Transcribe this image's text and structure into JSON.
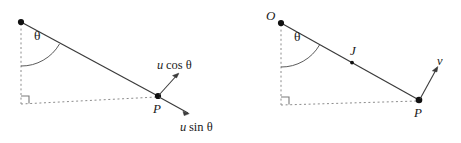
{
  "figure": {
    "background_color": "#ffffff",
    "stroke_color": "#3a3a3a",
    "dashed_color": "#808080",
    "text_color": "#1a1a1a",
    "panels": [
      {
        "id": "left-panel",
        "name": "projectile-components-diagram",
        "points": [
          {
            "id": "origin",
            "label": "",
            "x": 21,
            "y": 22
          },
          {
            "id": "point-p",
            "label": "P",
            "x": 158,
            "y": 96
          }
        ],
        "angle_label": "θ",
        "angle_vertex": "origin",
        "vector_labels": [
          {
            "id": "u-cos-theta",
            "symbol": "u",
            "fn": "cos θ",
            "text": "u cos θ"
          },
          {
            "id": "u-sin-theta",
            "symbol": "u",
            "fn": "sin θ",
            "text": "u sin θ"
          }
        ],
        "right_angle": true
      },
      {
        "id": "right-panel",
        "name": "velocity-vector-diagram",
        "points": [
          {
            "id": "origin-o",
            "label": "O",
            "x": 281,
            "y": 23
          },
          {
            "id": "point-j",
            "label": "J",
            "x": 352,
            "y": 62
          },
          {
            "id": "point-p",
            "label": "P",
            "x": 419,
            "y": 100
          }
        ],
        "angle_label": "θ",
        "angle_vertex": "origin-o",
        "vector_labels": [
          {
            "id": "v-vector",
            "symbol": "v",
            "text": "v"
          }
        ],
        "right_angle": true
      }
    ]
  },
  "labels": {
    "left": {
      "theta": "θ",
      "p": "P",
      "u_cos_u": "u",
      "u_cos_rest": "cos θ",
      "u_sin_u": "u",
      "u_sin_rest": "sin θ"
    },
    "right": {
      "o": "O",
      "theta": "θ",
      "j": "J",
      "p": "P",
      "v": "v"
    }
  }
}
